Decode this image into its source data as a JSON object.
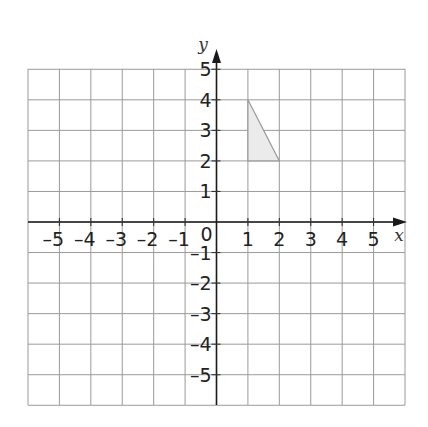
{
  "chart_data": {
    "type": "scatter",
    "title": "",
    "xlabel": "x",
    "ylabel": "y",
    "xlim": [
      -6,
      6
    ],
    "ylim": [
      -6,
      5
    ],
    "grid": true,
    "x_ticks": [
      -5,
      -4,
      -3,
      -2,
      -1,
      1,
      2,
      3,
      4,
      5
    ],
    "y_ticks": [
      5,
      4,
      3,
      2,
      1,
      -1,
      -2,
      -3,
      -4,
      -5
    ],
    "origin_label": "0",
    "shapes": [
      {
        "name": "triangle",
        "type": "polygon",
        "vertices": [
          [
            1,
            4
          ],
          [
            1,
            2
          ],
          [
            2,
            2
          ]
        ],
        "fill": "#ebebeb",
        "stroke": "#9a9a9a"
      }
    ]
  },
  "colors": {
    "grid": "#9a9a9a",
    "axis": "#1a1a1a",
    "shape_fill": "#ebebeb",
    "shape_stroke": "#9a9a9a"
  }
}
